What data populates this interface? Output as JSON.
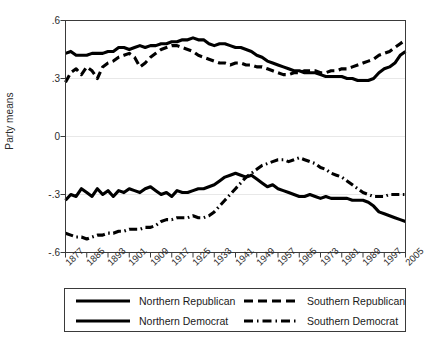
{
  "chart_data": {
    "type": "line",
    "title": "",
    "xlabel": "",
    "ylabel": "Party means",
    "xlim": [
      1877,
      2005
    ],
    "ylim": [
      -0.6,
      0.6
    ],
    "grid": true,
    "gridlines_y": [
      0.6,
      0.3,
      0.0,
      -0.3,
      -0.6
    ],
    "yticks": [
      0.6,
      0.3,
      0,
      -0.3,
      -0.6
    ],
    "ytick_labels": [
      ".6",
      ".3",
      "0",
      "-.3",
      "-.6"
    ],
    "xticks": [
      1877,
      1885,
      1893,
      1901,
      1909,
      1917,
      1925,
      1933,
      1941,
      1949,
      1957,
      1965,
      1973,
      1981,
      1989,
      1997,
      2005
    ],
    "xtick_labels": [
      "1877",
      "1885",
      "1893",
      "1901",
      "1909",
      "1917",
      "1925",
      "1933",
      "1941",
      "1949",
      "1957",
      "1965",
      "1973",
      "1981",
      "1989",
      "1997",
      "2005"
    ],
    "legend_position": "below",
    "series": [
      {
        "name": "Northern Republican",
        "style": "solid",
        "color": "#000000",
        "x": [
          1877,
          1879,
          1881,
          1883,
          1885,
          1887,
          1889,
          1891,
          1893,
          1895,
          1897,
          1899,
          1901,
          1903,
          1905,
          1907,
          1909,
          1911,
          1913,
          1915,
          1917,
          1919,
          1921,
          1923,
          1925,
          1927,
          1929,
          1931,
          1933,
          1935,
          1937,
          1939,
          1941,
          1943,
          1945,
          1947,
          1949,
          1951,
          1953,
          1955,
          1957,
          1959,
          1961,
          1963,
          1965,
          1967,
          1969,
          1971,
          1973,
          1975,
          1977,
          1979,
          1981,
          1983,
          1985,
          1987,
          1989,
          1991,
          1993,
          1995,
          1997,
          1999,
          2001,
          2003,
          2005
        ],
        "values": [
          0.43,
          0.44,
          0.42,
          0.42,
          0.42,
          0.43,
          0.43,
          0.43,
          0.44,
          0.44,
          0.46,
          0.46,
          0.45,
          0.46,
          0.47,
          0.46,
          0.47,
          0.47,
          0.48,
          0.48,
          0.49,
          0.49,
          0.5,
          0.5,
          0.51,
          0.5,
          0.5,
          0.48,
          0.47,
          0.48,
          0.48,
          0.47,
          0.46,
          0.46,
          0.45,
          0.44,
          0.42,
          0.41,
          0.39,
          0.38,
          0.37,
          0.36,
          0.35,
          0.34,
          0.34,
          0.33,
          0.33,
          0.33,
          0.32,
          0.31,
          0.31,
          0.31,
          0.31,
          0.3,
          0.3,
          0.29,
          0.29,
          0.29,
          0.3,
          0.33,
          0.35,
          0.36,
          0.38,
          0.42,
          0.44
        ]
      },
      {
        "name": "Southern Republican",
        "style": "dashed",
        "color": "#000000",
        "x": [
          1877,
          1879,
          1881,
          1883,
          1885,
          1887,
          1889,
          1891,
          1893,
          1895,
          1897,
          1899,
          1901,
          1903,
          1905,
          1907,
          1909,
          1911,
          1913,
          1915,
          1917,
          1919,
          1921,
          1923,
          1925,
          1927,
          1929,
          1931,
          1933,
          1935,
          1937,
          1939,
          1941,
          1943,
          1945,
          1947,
          1949,
          1951,
          1953,
          1955,
          1957,
          1959,
          1961,
          1963,
          1965,
          1967,
          1969,
          1971,
          1973,
          1975,
          1977,
          1979,
          1981,
          1983,
          1985,
          1987,
          1989,
          1991,
          1993,
          1995,
          1997,
          1999,
          2001,
          2003,
          2005
        ],
        "values": [
          0.28,
          0.33,
          0.35,
          0.32,
          0.36,
          0.34,
          0.3,
          0.36,
          0.38,
          0.39,
          0.41,
          0.42,
          0.43,
          0.41,
          0.36,
          0.38,
          0.41,
          0.43,
          0.45,
          0.46,
          0.47,
          0.47,
          0.46,
          0.45,
          0.44,
          0.42,
          0.41,
          0.4,
          0.39,
          0.38,
          0.38,
          0.37,
          0.38,
          0.38,
          0.37,
          0.37,
          0.36,
          0.36,
          0.35,
          0.34,
          0.33,
          0.32,
          0.32,
          0.33,
          0.33,
          0.34,
          0.34,
          0.34,
          0.33,
          0.33,
          0.34,
          0.34,
          0.35,
          0.35,
          0.36,
          0.37,
          0.38,
          0.39,
          0.4,
          0.42,
          0.43,
          0.44,
          0.46,
          0.48,
          0.5
        ]
      },
      {
        "name": "Northern Democrat",
        "style": "solid",
        "color": "#000000",
        "x": [
          1877,
          1879,
          1881,
          1883,
          1885,
          1887,
          1889,
          1891,
          1893,
          1895,
          1897,
          1899,
          1901,
          1903,
          1905,
          1907,
          1909,
          1911,
          1913,
          1915,
          1917,
          1919,
          1921,
          1923,
          1925,
          1927,
          1929,
          1931,
          1933,
          1935,
          1937,
          1939,
          1941,
          1943,
          1945,
          1947,
          1949,
          1951,
          1953,
          1955,
          1957,
          1959,
          1961,
          1963,
          1965,
          1967,
          1969,
          1971,
          1973,
          1975,
          1977,
          1979,
          1981,
          1983,
          1985,
          1987,
          1989,
          1991,
          1993,
          1995,
          1997,
          1999,
          2001,
          2003,
          2005
        ],
        "values": [
          -0.33,
          -0.3,
          -0.31,
          -0.27,
          -0.29,
          -0.31,
          -0.27,
          -0.3,
          -0.28,
          -0.31,
          -0.28,
          -0.29,
          -0.27,
          -0.28,
          -0.29,
          -0.27,
          -0.26,
          -0.28,
          -0.3,
          -0.29,
          -0.31,
          -0.28,
          -0.29,
          -0.29,
          -0.28,
          -0.27,
          -0.27,
          -0.26,
          -0.25,
          -0.23,
          -0.21,
          -0.2,
          -0.19,
          -0.2,
          -0.21,
          -0.2,
          -0.22,
          -0.24,
          -0.26,
          -0.25,
          -0.27,
          -0.28,
          -0.29,
          -0.3,
          -0.31,
          -0.31,
          -0.3,
          -0.31,
          -0.32,
          -0.31,
          -0.32,
          -0.32,
          -0.32,
          -0.32,
          -0.33,
          -0.33,
          -0.33,
          -0.34,
          -0.36,
          -0.39,
          -0.4,
          -0.41,
          -0.42,
          -0.43,
          -0.44
        ]
      },
      {
        "name": "Southern Democrat",
        "style": "dash-dot",
        "color": "#000000",
        "x": [
          1877,
          1879,
          1881,
          1883,
          1885,
          1887,
          1889,
          1891,
          1893,
          1895,
          1897,
          1899,
          1901,
          1903,
          1905,
          1907,
          1909,
          1911,
          1913,
          1915,
          1917,
          1919,
          1921,
          1923,
          1925,
          1927,
          1929,
          1931,
          1933,
          1935,
          1937,
          1939,
          1941,
          1943,
          1945,
          1947,
          1949,
          1951,
          1953,
          1955,
          1957,
          1959,
          1961,
          1963,
          1965,
          1967,
          1969,
          1971,
          1973,
          1975,
          1977,
          1979,
          1981,
          1983,
          1985,
          1987,
          1989,
          1991,
          1993,
          1995,
          1997,
          1999,
          2001,
          2003,
          2005
        ],
        "values": [
          -0.5,
          -0.51,
          -0.52,
          -0.52,
          -0.53,
          -0.52,
          -0.51,
          -0.51,
          -0.5,
          -0.5,
          -0.49,
          -0.49,
          -0.48,
          -0.48,
          -0.48,
          -0.47,
          -0.47,
          -0.46,
          -0.44,
          -0.43,
          -0.43,
          -0.42,
          -0.42,
          -0.42,
          -0.41,
          -0.42,
          -0.42,
          -0.41,
          -0.39,
          -0.36,
          -0.33,
          -0.3,
          -0.27,
          -0.24,
          -0.21,
          -0.19,
          -0.17,
          -0.15,
          -0.14,
          -0.13,
          -0.12,
          -0.12,
          -0.13,
          -0.12,
          -0.11,
          -0.12,
          -0.13,
          -0.14,
          -0.16,
          -0.17,
          -0.19,
          -0.2,
          -0.21,
          -0.23,
          -0.25,
          -0.27,
          -0.29,
          -0.3,
          -0.31,
          -0.31,
          -0.31,
          -0.3,
          -0.3,
          -0.3,
          -0.3
        ]
      }
    ]
  },
  "legend": {
    "entries": [
      {
        "label": "Northern Republican",
        "style": "solid"
      },
      {
        "label": "Southern Republican",
        "style": "dashed"
      },
      {
        "label": "Northern Democrat",
        "style": "solid"
      },
      {
        "label": "Southern Democrat",
        "style": "dash-dot"
      }
    ]
  }
}
